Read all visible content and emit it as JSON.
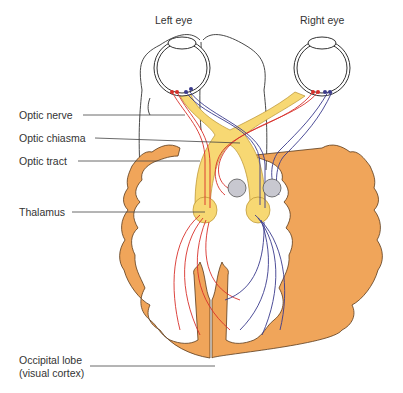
{
  "diagram": {
    "title_top_left": "Left eye",
    "title_top_right": "Right eye",
    "labels": {
      "optic_nerve": "Optic nerve",
      "optic_chiasma": "Optic chiasma",
      "optic_tract": "Optic tract",
      "thalamus": "Thalamus",
      "occipital_line1": "Occipital lobe",
      "occipital_line2": "(visual cortex)"
    },
    "colors": {
      "cortex": "#F0A55A",
      "cortex_outline": "#5a3a1a",
      "tract_fill": "#F7D873",
      "red_fiber": "#D8302A",
      "blue_fiber": "#3A3A8C",
      "nucleus": "#C8C8D0",
      "outline": "#333333"
    }
  }
}
